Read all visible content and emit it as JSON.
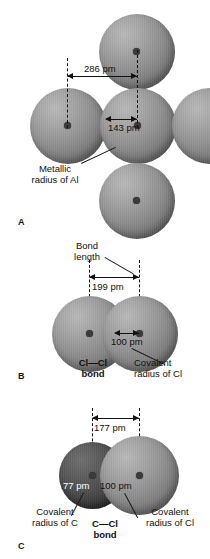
{
  "figure": {
    "units": "pm",
    "panels": [
      {
        "id": "A",
        "letter": "A",
        "substance": "Al",
        "dimensions": [
          {
            "name": "nuclear-separation",
            "value": "286 pm"
          },
          {
            "name": "metallic-radius",
            "value": "143 pm"
          }
        ],
        "callouts": [
          {
            "name": "metallic-radius-callout",
            "line1": "Metallic",
            "line2": "radius of Al"
          }
        ]
      },
      {
        "id": "B",
        "letter": "B",
        "substance": "Cl2",
        "dimensions": [
          {
            "name": "bond-length",
            "value": "199 pm"
          },
          {
            "name": "covalent-radius-cl",
            "value": "100 pm"
          }
        ],
        "callouts": [
          {
            "name": "bond-length-callout",
            "line1": "Bond",
            "line2": "length"
          },
          {
            "name": "covalent-radius-cl-callout",
            "line1": "Covalent",
            "line2": "radius of Cl"
          }
        ],
        "bond_label": {
          "line1": "Cl—Cl",
          "line2": "bond"
        }
      },
      {
        "id": "C",
        "letter": "C",
        "substance": "CCl",
        "dimensions": [
          {
            "name": "bond-length",
            "value": "177 pm"
          },
          {
            "name": "covalent-radius-c",
            "value": "77 pm"
          },
          {
            "name": "covalent-radius-cl",
            "value": "100 pm"
          }
        ],
        "callouts": [
          {
            "name": "covalent-radius-c-callout",
            "line1": "Covalent",
            "line2": "radius of C"
          },
          {
            "name": "covalent-radius-cl-callout",
            "line1": "Covalent",
            "line2": "radius of Cl"
          }
        ],
        "bond_label": {
          "line1": "C—Cl",
          "line2": "bond"
        }
      }
    ]
  },
  "colors": {
    "ink": "#111111",
    "sphere_light": "#939393",
    "sphere_dark": "#3c3c3c",
    "background": "#ffffff"
  }
}
